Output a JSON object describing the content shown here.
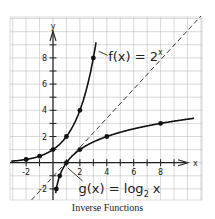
{
  "caption": "Inverse Functions",
  "chart_data": {
    "type": "line",
    "title": "Inverse Functions",
    "xlabel": "x",
    "ylabel": "y",
    "xlim": [
      -3,
      11
    ],
    "ylim": [
      -3,
      11
    ],
    "grid": true,
    "x_tick_labels": [
      "-2",
      "2",
      "4",
      "6",
      "8"
    ],
    "y_tick_labels": [
      "-2",
      "2",
      "4",
      "6",
      "8"
    ],
    "x_ticks": [
      -2,
      2,
      4,
      6,
      8
    ],
    "y_ticks": [
      -2,
      2,
      4,
      6,
      8
    ],
    "series": [
      {
        "name": "f(x) = 2^x",
        "label_text": "f(x) = 2",
        "label_exponent": "x",
        "style": "solid",
        "points": [
          [
            -2,
            0.25
          ],
          [
            -1,
            0.5
          ],
          [
            0,
            1
          ],
          [
            1,
            2
          ],
          [
            2,
            4
          ],
          [
            3,
            8
          ]
        ]
      },
      {
        "name": "g(x) = log2 x",
        "label_text": "g(x) = log",
        "label_subscript": "2",
        "label_suffix": " x",
        "style": "solid",
        "points": [
          [
            0.25,
            -2
          ],
          [
            0.5,
            -1
          ],
          [
            1,
            0
          ],
          [
            2,
            1
          ],
          [
            4,
            2
          ],
          [
            8,
            3
          ]
        ]
      },
      {
        "name": "y = x",
        "style": "dashed",
        "points": [
          [
            -3,
            -3
          ],
          [
            11,
            11
          ]
        ]
      }
    ]
  }
}
